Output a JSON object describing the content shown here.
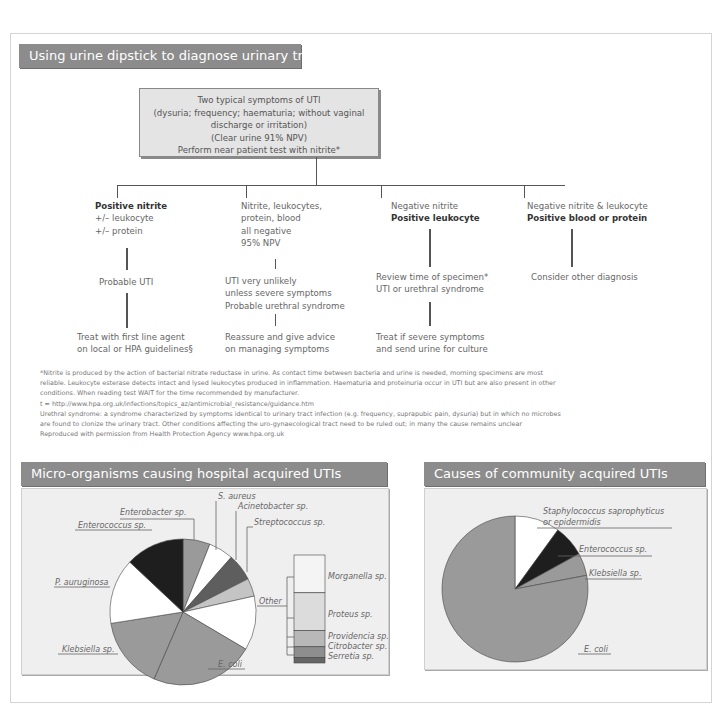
{
  "flowchart": {
    "title": "Using urine dipstick to diagnose urinary tract infection (UTI)",
    "top_box": [
      "Two typical symptoms of UTI",
      "(dysuria; frequency; haematuria; without vaginal discharge or irritation)",
      "(Clear urine 91% NPV)",
      "Perform near patient test with nitrite*"
    ],
    "branches": [
      {
        "condition": [
          "Positive nitrite",
          "+/– leukocyte",
          " +/– protein"
        ],
        "bold_lines": [
          0
        ],
        "interpretation": [
          "Probable UTI"
        ],
        "action": [
          "Treat with first line agent",
          "on local or HPA guidelines§"
        ]
      },
      {
        "condition": [
          "Nitrite, leukocytes,",
          "protein, blood",
          "all negative",
          "95% NPV"
        ],
        "bold_lines": [],
        "interpretation": [
          "UTI very unlikely",
          "unless severe symptoms",
          "Probable urethral syndrome"
        ],
        "action": [
          "Reassure and give advice",
          "on managing symptoms"
        ]
      },
      {
        "condition": [
          "Negative nitrite",
          "Positive leukocyte"
        ],
        "bold_lines": [
          1
        ],
        "interpretation": [
          "Review time of specimen*",
          "UTI or urethral syndrome"
        ],
        "action": [
          "Treat if severe symptoms",
          "and send urine for culture"
        ]
      },
      {
        "condition": [
          "Negative nitrite & leukocyte",
          "Positive blood or protein"
        ],
        "bold_lines": [
          1
        ],
        "interpretation": [
          "Consider other diagnosis"
        ],
        "action": []
      }
    ],
    "notes": [
      "*Nitrite is produced by the action of bacterial nitrate reductase in urine. As contact time between bacteria and urine is needed, morning specimens are most",
      "reliable.  Leukocyte esterase detects intact and lysed leukocytes produced in inflammation.  Haematuria and proteinuria occur in UTI but are also present in other",
      "conditions. When reading test WAIT for the time recommended by manufacturer.",
      "t =  http://www.hpa.org.uk/infections/topics_az/antimicrobial_resistance/guidance.htm",
      "  Urethral syndrome: a syndrome characterized by symptoms identical to urinary tract infection (e.g. frequency, suprapubic pain, dysuria) but in which no microbes",
      "are found to clonize the urinary tract. Other conditions affecting the uro-gynaecological tract need to be ruled out; in many the cause remains unclear",
      "Reproduced with permission from Health Protection Agency www.hpa.org.uk"
    ]
  },
  "chart_data": [
    {
      "type": "pie",
      "title": "Micro-organisms causing hospital acquired UTIs",
      "categories": [
        "Enterobacter sp.",
        "S. aureus",
        "Acinetobacter sp.",
        "Streptococcus sp.",
        "Other",
        "E. coli",
        "Klebsiella sp.",
        "P. auruginosa",
        "Enterococcus sp."
      ],
      "values": [
        6,
        5.5,
        6,
        4,
        12,
        23,
        16,
        14.5,
        13
      ],
      "colors": [
        "#9a9a9a",
        "#ffffff",
        "#5e5e5e",
        "#c4c4c4",
        "#ffffff",
        "#9a9a9a",
        "#9a9a9a",
        "#ffffff",
        "#1e1e1e"
      ],
      "other_breakdown": {
        "type": "stacked_bar",
        "categories": [
          "Morganella sp.",
          "Proteus sp.",
          "Providencia sp.",
          "Citrobacter sp.",
          "Serretia sp."
        ],
        "values": [
          35,
          35,
          15,
          10,
          5
        ],
        "colors": [
          "#f4f4f4",
          "#dcdcdc",
          "#b8b8b8",
          "#8e8e8e",
          "#666666"
        ]
      }
    },
    {
      "type": "pie",
      "title": "Causes of community acquired UTIs",
      "categories": [
        "Staphylococcus saprophyticus or epidermidis",
        "Enterococcus sp.",
        "Klebsiella sp.",
        "E. coli"
      ],
      "values": [
        10,
        7,
        5,
        78
      ],
      "colors": [
        "#ffffff",
        "#1e1e1e",
        "#9a9a9a",
        "#9a9a9a"
      ]
    }
  ],
  "labels": {
    "hospital": {
      "enterobacter": "Enterobacter sp.",
      "s_aureus": "S. aureus",
      "acinetobacter": "Acinetobacter sp.",
      "streptococcus": "Streptococcus sp.",
      "enterococcus": "Enterococcus sp.",
      "p_aeruginosa": "P. auruginosa",
      "klebsiella": "Klebsiella sp.",
      "e_coli": "E. coli",
      "other": "Other",
      "morganella": "Morganella sp.",
      "proteus": "Proteus sp.",
      "providencia": "Providencia sp.",
      "citrobacter": "Citrobacter sp.",
      "serretia": "Serretia sp."
    },
    "community": {
      "staph_line1": "Staphylococcus saprophyticus",
      "staph_line2": "or epidermidis",
      "enterococcus": "Enterococcus sp.",
      "klebsiella": "Klebsiella sp.",
      "e_coli": "E. coli"
    }
  }
}
